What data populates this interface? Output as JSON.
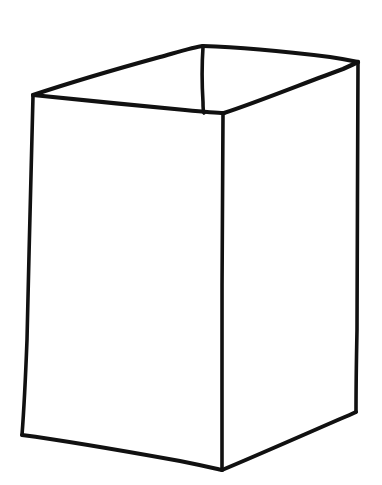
{
  "document": {
    "kind": "line-drawing",
    "title": "Open box in perspective",
    "subject": "cuboid-open-top",
    "technique": "hand-drawn ink contour sketch",
    "background_color": "#ffffff",
    "stroke_color": "#111111",
    "canvas": {
      "width": 382,
      "height": 485
    }
  },
  "drawing": {
    "vertices": {
      "rim_back_center": {
        "x": 203,
        "y": 46,
        "label": "back top corner"
      },
      "rim_left": {
        "x": 33,
        "y": 95,
        "label": "left top corner"
      },
      "rim_right": {
        "x": 358,
        "y": 62,
        "label": "right top corner"
      },
      "rim_front_center": {
        "x": 224,
        "y": 113,
        "label": "front top corner"
      },
      "base_left": {
        "x": 22,
        "y": 435,
        "label": "left bottom corner"
      },
      "base_front_center": {
        "x": 222,
        "y": 470,
        "label": "front bottom corner"
      },
      "base_right": {
        "x": 356,
        "y": 412,
        "label": "right bottom corner"
      }
    },
    "strokes": [
      {
        "name": "rim-back-left-edge",
        "description": "top rim, back-left segment",
        "d": "M33,95 C60,86 120,68 160,57 C178,52 194,47 203,46",
        "width": 4.2
      },
      {
        "name": "rim-back-right-edge",
        "description": "top rim, back-right segment",
        "d": "M203,46 C240,47 290,52 330,57 C344,59 353,61 358,62",
        "width": 4.2
      },
      {
        "name": "rim-front-left-edge",
        "description": "top rim, front-left segment (near side)",
        "d": "M33,95 C72,99 140,106 185,110 C205,112 218,113 224,113",
        "width": 4.2
      },
      {
        "name": "rim-front-right-edge",
        "description": "top rim, front-right segment (near side)",
        "d": "M224,113 C258,102 312,80 343,69 C352,65 356,63 358,62",
        "width": 4.2
      },
      {
        "name": "inner-back-vertical-edge",
        "description": "short vertical from back corner to front corner showing box interior",
        "d": "M203,47 C202,62 202,86 203,102 C203,108 203,111 204,113",
        "width": 3.6
      },
      {
        "name": "left-vertical-edge",
        "description": "left side vertical edge",
        "d": "M33,96 C31,160 29,260 27,340 C25,392 23,422 22,435",
        "width": 3.6
      },
      {
        "name": "center-vertical-edge",
        "description": "front corner vertical edge",
        "d": "M223,114 C222,190 222,300 222,390 C222,440 222,462 222,470",
        "width": 3.6
      },
      {
        "name": "right-vertical-edge",
        "description": "right side vertical edge",
        "d": "M358,63 C358,140 357,250 357,330 C356,380 356,402 356,412",
        "width": 3.6
      },
      {
        "name": "base-left-edge",
        "description": "bottom front-left edge",
        "d": "M22,435 C60,440 130,452 180,461 C205,466 217,469 222,470",
        "width": 4.0
      },
      {
        "name": "base-right-edge",
        "description": "bottom front-right edge",
        "d": "M222,470 C258,455 310,432 340,419 C350,415 354,413 356,412",
        "width": 4.0
      }
    ],
    "faces": [
      {
        "name": "left-face",
        "visible": true,
        "fill": "#ffffff"
      },
      {
        "name": "right-face",
        "visible": true,
        "fill": "#ffffff"
      },
      {
        "name": "top-opening",
        "visible": true,
        "fill": "#ffffff"
      }
    ]
  }
}
